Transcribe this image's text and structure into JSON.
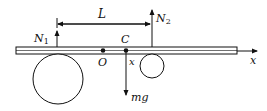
{
  "diagram": {
    "type": "free-body diagram",
    "labels": {
      "N1": "N",
      "N1_sub": "1",
      "N2": "N",
      "N2_sub": "2",
      "L": "L",
      "O": "O",
      "C": "C",
      "x_pos": "x",
      "mg": "mg",
      "axis": "x"
    },
    "colors": {
      "stroke": "#111111",
      "background": "#ffffff"
    },
    "elements": [
      {
        "name": "rod",
        "kind": "horizontal bar"
      },
      {
        "name": "large-roller",
        "kind": "circle",
        "position": "left"
      },
      {
        "name": "small-roller",
        "kind": "circle",
        "position": "right"
      },
      {
        "name": "N1-force",
        "kind": "arrow up"
      },
      {
        "name": "N2-force",
        "kind": "arrow up"
      },
      {
        "name": "weight-force",
        "kind": "arrow down",
        "label": "mg"
      },
      {
        "name": "distance-L",
        "kind": "dimension arrow",
        "label": "L"
      },
      {
        "name": "x-axis",
        "kind": "arrow right",
        "label": "x"
      }
    ]
  }
}
